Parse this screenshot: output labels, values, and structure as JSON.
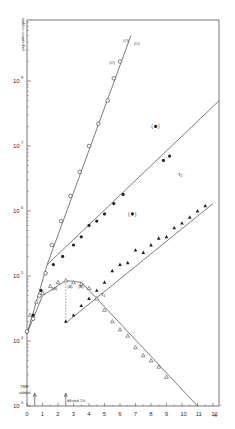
{
  "chart_data": {
    "type": "scatter",
    "title": "",
    "xlabel": "h",
    "ylabel": "viables counted/ml",
    "yscale": "log",
    "xlim": [
      0,
      12.4
    ],
    "ylim": [
      1000,
      500000000
    ],
    "x_ticks": [
      "0",
      "1",
      "2",
      "3",
      "4",
      "5",
      "6",
      "7",
      "8",
      "9",
      "10",
      "11",
      "12"
    ],
    "y_ticks": [
      {
        "exp": "3",
        "value": 1000
      },
      {
        "exp": "4",
        "value": 10000
      },
      {
        "exp": "5",
        "value": 100000
      },
      {
        "exp": "6",
        "value": 1000000
      },
      {
        "exp": "7",
        "value": 10000000
      },
      {
        "exp": "8",
        "value": 100000000
      }
    ],
    "grid": false,
    "legend": "none",
    "series": [
      {
        "name": "open circles (undiluted culture)",
        "marker": "open-circle",
        "points": [
          [
            0,
            14000
          ],
          [
            0.4,
            22000
          ],
          [
            0.8,
            50000
          ],
          [
            1.2,
            110000
          ],
          [
            1.6,
            300000
          ],
          [
            2.2,
            700000
          ],
          [
            2.8,
            1700000
          ],
          [
            3.4,
            4000000
          ],
          [
            4.0,
            10000000
          ],
          [
            4.6,
            22000000
          ],
          [
            5.2,
            50000000
          ],
          [
            5.6,
            110000000
          ],
          [
            6.0,
            200000000
          ]
        ],
        "fit_line": [
          [
            0,
            13000
          ],
          [
            1.3,
            150000
          ],
          [
            6.7,
            500000000
          ]
        ]
      },
      {
        "name": "filled circles",
        "marker": "filled-circle",
        "points": [
          [
            0.4,
            25000
          ],
          [
            0.9,
            60000
          ],
          [
            1.7,
            150000
          ],
          [
            2.3,
            200000
          ],
          [
            3.0,
            300000
          ],
          [
            3.5,
            400000
          ],
          [
            4.0,
            600000
          ],
          [
            4.5,
            700000
          ],
          [
            5.0,
            900000
          ],
          [
            5.6,
            1300000
          ],
          [
            6.2,
            1800000
          ],
          [
            8.8,
            6000000
          ],
          [
            9.2,
            7000000
          ]
        ],
        "fit_line": [
          [
            1.3,
            150000
          ],
          [
            12.4,
            50000000
          ]
        ]
      },
      {
        "name": "filled triangles (diluted culture)",
        "marker": "filled-triangle",
        "points": [
          [
            2.5,
            20000
          ],
          [
            3.0,
            25000
          ],
          [
            3.5,
            35000
          ],
          [
            4.0,
            45000
          ],
          [
            4.5,
            60000
          ],
          [
            5.0,
            80000
          ],
          [
            5.5,
            120000
          ],
          [
            6.0,
            150000
          ],
          [
            6.5,
            160000
          ],
          [
            7.0,
            250000
          ],
          [
            7.5,
            230000
          ],
          [
            8.0,
            300000
          ],
          [
            8.5,
            380000
          ],
          [
            9.0,
            400000
          ],
          [
            9.5,
            550000
          ],
          [
            10.0,
            650000
          ],
          [
            10.5,
            800000
          ],
          [
            11.0,
            1000000
          ],
          [
            11.5,
            1200000
          ]
        ],
        "fit_line": [
          [
            2.5,
            19000
          ],
          [
            12.0,
            1300000
          ]
        ]
      },
      {
        "name": "open triangles (decline)",
        "marker": "open-triangle",
        "points": [
          [
            0.2,
            25000
          ],
          [
            0.6,
            40000
          ],
          [
            1.0,
            55000
          ],
          [
            1.5,
            70000
          ],
          [
            2.0,
            80000
          ],
          [
            2.5,
            85000
          ],
          [
            3.0,
            80000
          ],
          [
            3.5,
            75000
          ],
          [
            4.0,
            65000
          ],
          [
            4.5,
            45000
          ],
          [
            5.0,
            30000
          ],
          [
            5.5,
            20000
          ],
          [
            6.0,
            15000
          ],
          [
            6.5,
            12000
          ],
          [
            7.0,
            8000
          ],
          [
            7.5,
            6000
          ],
          [
            8.0,
            5000
          ],
          [
            8.5,
            4000
          ],
          [
            9.0,
            2800
          ]
        ],
        "fit_line": [
          [
            0,
            13000
          ],
          [
            1.0,
            50000
          ],
          [
            2.5,
            85000
          ],
          [
            3.5,
            80000
          ],
          [
            4.5,
            45000
          ],
          [
            11.0,
            1000
          ]
        ]
      },
      {
        "name": "bracketed points (excluded)",
        "marker": "bracketed-filled-circle",
        "points": [
          [
            8.3,
            20000000
          ],
          [
            6.8,
            900000
          ]
        ]
      }
    ],
    "annotations": [
      {
        "text": "(O)",
        "x": 6.2,
        "y": 400000000
      },
      {
        "text": "(O)",
        "x": 6.9,
        "y": 360000000
      },
      {
        "text": "(O)",
        "x": 5.3,
        "y": 180000000
      },
      {
        "text": "τ2",
        "x": 10.8,
        "y": 1500000
      },
      {
        "text": "τ1",
        "x": 4.8,
        "y": 100000
      },
      {
        "text": "(Δ)",
        "x": 2.6,
        "y": 65000
      },
      {
        "text": "(Δ)",
        "x": 3.3,
        "y": 65000
      },
      {
        "text": "(Δ)",
        "x": 1.6,
        "y": 60000
      },
      {
        "text": "TMP added",
        "x": 0.5,
        "y": 1800
      },
      {
        "text": "diluted 1:k",
        "x": 2.5,
        "y": 1300
      }
    ],
    "arrows": [
      {
        "x": 0.5,
        "label": "TMP added"
      },
      {
        "x": 2.5,
        "label": "diluted 1:k"
      }
    ],
    "dilution_drop": {
      "x": 2.5,
      "from": 85000,
      "to": 20000
    }
  },
  "labels": {
    "ylabel": "viables counted/ml",
    "xunit": "h",
    "tmp_line1": "TMP",
    "tmp_line2": "added",
    "diluted": "diluted 1:k",
    "tau1": "τ₁",
    "tau2": "τ₂",
    "caption": "Figure caption (illegible)"
  }
}
